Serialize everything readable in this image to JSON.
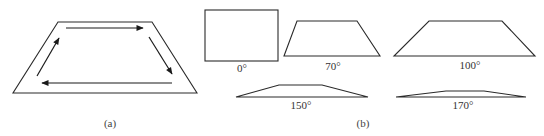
{
  "figure": {
    "panel_a": {
      "label": "(a)",
      "outer_trapezoid": {
        "top": [
          [
            58,
            22
          ],
          [
            152,
            22
          ]
        ],
        "bottom": [
          [
            13,
            93
          ],
          [
            197,
            93
          ]
        ]
      },
      "arrows": [
        {
          "name": "top-arrow",
          "from": [
            66,
            28
          ],
          "to": [
            143,
            28
          ],
          "direction": "right"
        },
        {
          "name": "right-arrow",
          "from": [
            149,
            37
          ],
          "to": [
            172,
            74
          ],
          "direction": "down-right"
        },
        {
          "name": "bottom-arrow",
          "from": [
            172,
            83
          ],
          "to": [
            42,
            83
          ],
          "direction": "left"
        },
        {
          "name": "left-arrow",
          "from": [
            37,
            76
          ],
          "to": [
            59,
            38
          ],
          "direction": "up-right"
        }
      ],
      "circulation": "clockwise"
    },
    "panel_b": {
      "label": "(b)",
      "shapes": [
        {
          "angle_label": "0°",
          "kind": "rectangle"
        },
        {
          "angle_label": "70°",
          "kind": "trapezoid"
        },
        {
          "angle_label": "100°",
          "kind": "trapezoid"
        },
        {
          "angle_label": "150°",
          "kind": "trapezoid"
        },
        {
          "angle_label": "170°",
          "kind": "trapezoid"
        }
      ]
    }
  },
  "colors": {
    "stroke": "#2a2a2a",
    "text": "#333333",
    "background": "#ffffff"
  }
}
